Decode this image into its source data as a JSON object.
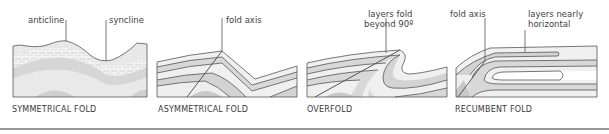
{
  "colors": {
    "outline": "#555555",
    "layer_light": "#f1f1f1",
    "layer_mid": "#dcdcdc",
    "layer_dark": "#c4c4c4",
    "brick": "#d6d6d6",
    "rule": "#9a9a9a"
  },
  "panels": [
    {
      "id": "symmetrical",
      "caption": "SYMMETRICAL FOLD",
      "labels": {
        "left": "anticline",
        "right": "syncline"
      }
    },
    {
      "id": "asymmetrical",
      "caption": "ASYMMETRICAL FOLD",
      "labels": {
        "axis": "fold axis"
      }
    },
    {
      "id": "overfold",
      "caption": "OVERFOLD",
      "labels": {
        "line1": "layers fold",
        "line2": "beyond 90º"
      }
    },
    {
      "id": "recumbent",
      "caption": "RECUMBENT FOLD",
      "labels": {
        "axis": "fold axis",
        "line1": "layers nearly",
        "line2": "horizontal"
      }
    }
  ]
}
